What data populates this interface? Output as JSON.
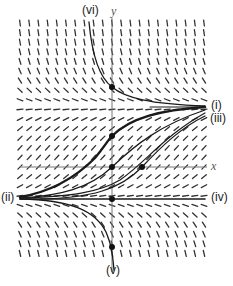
{
  "diagram": {
    "type": "slope-field",
    "title": "",
    "axes": {
      "x_label": "x",
      "y_label": "y",
      "x_axis_px_y": 167,
      "y_axis_px_x": 112,
      "x_range_px": [
        20,
        207
      ],
      "y_range_px": [
        18,
        272
      ]
    },
    "field": {
      "x_start": 20,
      "x_end": 205,
      "x_step": 9.2,
      "y_start": 23,
      "y_end": 262,
      "y_step": 9.6,
      "upper_equilibrium_px_y": 107,
      "lower_equilibrium_px_y": 199,
      "mark_length": 6,
      "color": "#333333"
    },
    "equilibria": [
      {
        "label": "(i)",
        "px_y": 107
      },
      {
        "label": "(iv)",
        "px_y": 199
      }
    ],
    "curve_labels": [
      {
        "id": "i",
        "text": "(i)",
        "x": 211,
        "y": 99
      },
      {
        "id": "ii",
        "text": "(ii)",
        "x": 1,
        "y": 191
      },
      {
        "id": "iii",
        "text": "(iii)",
        "x": 210,
        "y": 112
      },
      {
        "id": "iv",
        "text": "(iv)",
        "x": 211,
        "y": 191
      },
      {
        "id": "v",
        "text": "(v)",
        "x": 106,
        "y": 264
      },
      {
        "id": "vi",
        "text": "(vi)",
        "x": 82,
        "y": 4
      }
    ],
    "axis_labels": [
      {
        "id": "y",
        "text": "y",
        "x": 111,
        "y": 5
      },
      {
        "id": "x",
        "text": "x",
        "x": 211,
        "y": 160
      }
    ],
    "curves": [
      {
        "id": "vi",
        "width": 1.3,
        "d": "M 89 22 C 92 55, 100 78, 112 87 C 125 98, 150 104, 205 106"
      },
      {
        "id": "thick",
        "width": 2.4,
        "d": "M 20 197 C 50 192, 75 178, 95 158 C 105 146, 108 140, 112 136 C 130 118, 160 110, 205 107"
      },
      {
        "id": "mid-a",
        "width": 1.2,
        "d": "M 20 198 C 60 196, 90 188, 112 167 C 135 145, 160 125, 205 110"
      },
      {
        "id": "mid-b",
        "width": 1.2,
        "d": "M 20 198 C 70 197, 100 192, 120 180 C 145 163, 165 135, 205 113"
      },
      {
        "id": "mid-c",
        "width": 1.2,
        "d": "M 40 199 C 90 198, 120 190, 142 167 C 160 148, 180 128, 205 116"
      },
      {
        "id": "iv-line",
        "width": 1.6,
        "d": "M 20 199 L 205 199"
      },
      {
        "id": "i-line",
        "width": 1.0,
        "d": "M 150 107 L 205 107"
      },
      {
        "id": "v",
        "width": 1.3,
        "d": "M 20 199 C 70 200, 95 210, 106 232 C 110 242, 112 247, 114 270"
      }
    ],
    "points": [
      {
        "x": 112,
        "y": 87
      },
      {
        "x": 112,
        "y": 136
      },
      {
        "x": 112,
        "y": 167
      },
      {
        "x": 142,
        "y": 167
      },
      {
        "x": 112,
        "y": 199
      },
      {
        "x": 112,
        "y": 247
      }
    ],
    "colors": {
      "curve": "#1a1a1a",
      "axis": "#777777",
      "point": "#111111"
    }
  }
}
